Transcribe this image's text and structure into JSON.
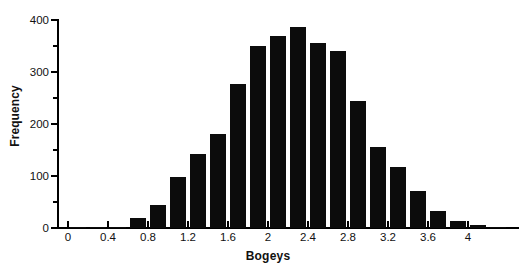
{
  "chart_data": {
    "type": "bar",
    "subtype": "histogram",
    "title": "",
    "xlabel": "Bogeys",
    "ylabel": "Frequency",
    "xlim": [
      -0.1,
      4.5
    ],
    "ylim": [
      0,
      400
    ],
    "grid": false,
    "legend": null,
    "bin_width": 0.2,
    "y_ticks": [
      0,
      100,
      200,
      300,
      400
    ],
    "y_tick_labels": [
      "0",
      "100",
      "200",
      "300",
      "400"
    ],
    "y_minor_ticks": [
      50,
      150,
      250,
      350
    ],
    "x_ticks": [
      0,
      0.4,
      0.8,
      1.2,
      1.6,
      2,
      2.4,
      2.8,
      3.2,
      3.6,
      4
    ],
    "x_tick_labels": [
      "0",
      "0.4",
      "0.8",
      "1.2",
      "1.6",
      "2",
      "2.4",
      "2.8",
      "3.2",
      "3.6",
      "4"
    ],
    "bin_starts": [
      0.0,
      0.2,
      0.4,
      0.6,
      0.8,
      1.0,
      1.2,
      1.4,
      1.6,
      1.8,
      2.0,
      2.2,
      2.4,
      2.6,
      2.8,
      3.0,
      3.2,
      3.4,
      3.6,
      3.8,
      4.0,
      4.2
    ],
    "bin_centers": [
      0.1,
      0.3,
      0.5,
      0.7,
      0.9,
      1.1,
      1.3,
      1.5,
      1.7,
      1.9,
      2.1,
      2.3,
      2.5,
      2.7,
      2.9,
      3.1,
      3.3,
      3.5,
      3.7,
      3.9,
      4.1,
      4.3
    ],
    "categories": [
      "0.0-0.2",
      "0.2-0.4",
      "0.4-0.6",
      "0.6-0.8",
      "0.8-1.0",
      "1.0-1.2",
      "1.2-1.4",
      "1.4-1.6",
      "1.6-1.8",
      "1.8-2.0",
      "2.0-2.2",
      "2.2-2.4",
      "2.4-2.6",
      "2.6-2.8",
      "2.8-3.0",
      "3.0-3.2",
      "3.2-3.4",
      "3.4-3.6",
      "3.6-3.8",
      "3.8-4.0",
      "4.0-4.2",
      "4.2-4.4"
    ],
    "values": [
      1,
      1,
      2,
      20,
      45,
      98,
      142,
      181,
      277,
      350,
      369,
      387,
      356,
      340,
      245,
      156,
      118,
      71,
      33,
      13,
      5,
      1
    ],
    "bar_color": "#0c0c0c",
    "axis_color": "#000000"
  },
  "axes": {
    "x_title": "Bogeys",
    "y_title": "Frequency"
  }
}
